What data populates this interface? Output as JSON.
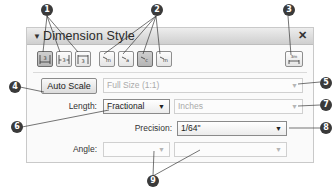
{
  "panel": {
    "title": "Dimension Style",
    "collapse_icon": "▼",
    "close_icon": "✕"
  },
  "toolbar": {
    "text_position_buttons": [
      {
        "name": "text-inline-button",
        "glyph": "|3|",
        "active": true
      },
      {
        "name": "text-above-button",
        "glyph": "|3|",
        "active": false
      },
      {
        "name": "text-outside-button",
        "glyph": "|3|",
        "active": false
      }
    ],
    "arrow_style_buttons": [
      {
        "name": "arrow-style-1-button",
        "glyph": "↗",
        "active": false
      },
      {
        "name": "arrow-style-2-button",
        "glyph": "↗",
        "active": false
      },
      {
        "name": "arrow-style-3-button",
        "glyph": "↗",
        "active": true
      },
      {
        "name": "arrow-style-4-button",
        "glyph": "↗",
        "active": false
      }
    ],
    "dimension_settings_button": {
      "glyph": "3m"
    }
  },
  "form": {
    "auto_scale_label": "Auto Scale",
    "scale_value": "Full Size (1:1)",
    "length_label": "Length:",
    "length_value": "Fractional",
    "units_value": "Inches",
    "precision_label": "Precision:",
    "precision_value": "1/64\"",
    "angle_label": "Angle:",
    "angle_value_1": "",
    "angle_value_2": "",
    "dropdown_arrow": "▼"
  },
  "callouts": [
    "1",
    "2",
    "3",
    "4",
    "5",
    "6",
    "7",
    "8",
    "9"
  ]
}
